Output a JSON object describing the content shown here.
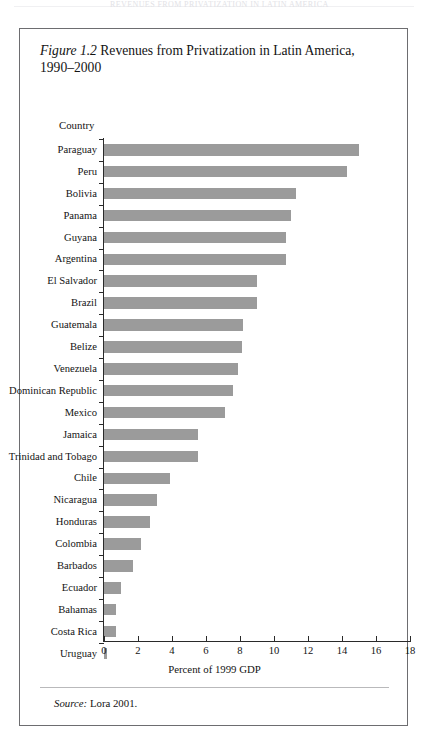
{
  "page": {
    "running_head": "REVENUES FROM PRIVATIZATION IN LATIN AMERICA"
  },
  "figure": {
    "number_label": "Figure 1.2",
    "title_text": " Revenues from Privatization in Latin America, 1990–2000",
    "source_word": "Source:",
    "source_text": " Lora 2001."
  },
  "chart_data": {
    "type": "bar",
    "orientation": "horizontal",
    "title": "Figure 1.2 Revenues from Privatization in Latin America, 1990–2000",
    "xlabel": "Percent of 1999 GDP",
    "ylabel": "Country",
    "xlim": [
      0,
      18
    ],
    "xticks": [
      0,
      2,
      4,
      6,
      8,
      10,
      12,
      14,
      16,
      18
    ],
    "xtick_labels": [
      "0",
      "2",
      "4",
      "6",
      "8",
      "10",
      "12",
      "14",
      "16",
      "18"
    ],
    "grid": false,
    "legend": false,
    "bar_color": "#9b9b9b",
    "categories": [
      "Paraguay",
      "Peru",
      "Bolivia",
      "Panama",
      "Guyana",
      "Argentina",
      "El Salvador",
      "Brazil",
      "Guatemala",
      "Belize",
      "Venezuela",
      "Dominican Republic",
      "Mexico",
      "Jamaica",
      "Trinidad and Tobago",
      "Chile",
      "Nicaragua",
      "Honduras",
      "Colombia",
      "Barbados",
      "Ecuador",
      "Bahamas",
      "Costa Rica",
      "Uruguay"
    ],
    "values": [
      15.0,
      14.3,
      11.3,
      11.0,
      10.7,
      10.7,
      9.0,
      9.0,
      8.2,
      8.1,
      7.9,
      7.6,
      7.1,
      5.5,
      5.5,
      3.9,
      3.1,
      2.7,
      2.2,
      1.7,
      1.0,
      0.7,
      0.7,
      0.2
    ]
  }
}
